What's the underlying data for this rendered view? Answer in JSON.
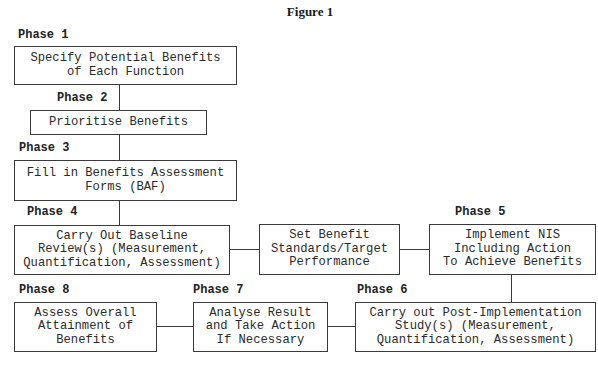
{
  "figure": {
    "title": "Figure 1"
  },
  "phases": [
    {
      "label": "Phase 1",
      "text": "Specify Potential Benefits\nof Each Function"
    },
    {
      "label": "Phase 2",
      "text": "Prioritise Benefits"
    },
    {
      "label": "Phase 3",
      "text": "Fill in Benefits Assessment\nForms (BAF)"
    },
    {
      "label": "Phase 4",
      "text": "Carry Out Baseline\nReview(s) (Measurement,\nQuantification, Assessment)"
    },
    {
      "label": "Phase 5",
      "text": "Implement NIS\nIncluding Action\nTo Achieve Benefits"
    },
    {
      "label": "Phase 6",
      "text": "Carry out Post-Implementation\nStudy(s) (Measurement,\nQuantification, Assessment)"
    },
    {
      "label": "Phase 7",
      "text": "Analyse Result\nand Take Action\nIf Necessary"
    },
    {
      "label": "Phase 8",
      "text": "Assess Overall\nAttainment of\nBenefits"
    }
  ],
  "intermediate": {
    "text": "Set Benefit\nStandards/Target\nPerformance"
  },
  "colors": {
    "line": "#3a3a3a",
    "text": "#2a2a2a",
    "background": "#ffffff"
  }
}
